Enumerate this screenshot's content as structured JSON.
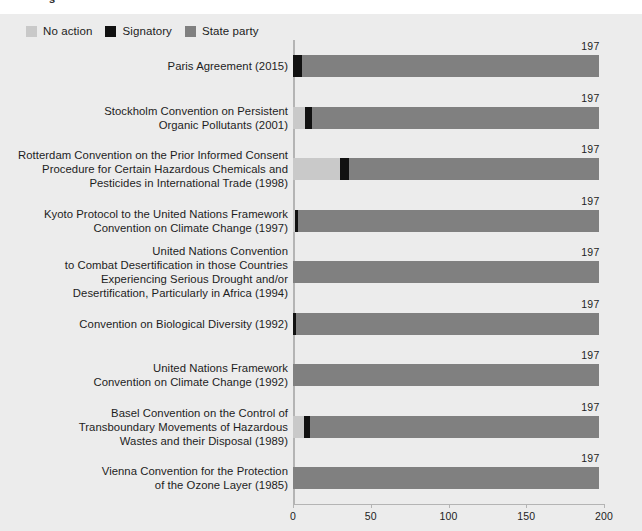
{
  "figure": {
    "cropped_top_text": "s",
    "background": "#ececec"
  },
  "legend": {
    "items": [
      {
        "label": "No action",
        "color": "#c9c9c9",
        "key": "no_action"
      },
      {
        "label": "Signatory",
        "color": "#111111",
        "key": "signatory"
      },
      {
        "label": "State party",
        "color": "#808080",
        "key": "state_party"
      }
    ]
  },
  "chart_data": {
    "type": "bar",
    "orientation": "horizontal",
    "stacked": true,
    "title": "",
    "subtitle": "",
    "xlabel": "",
    "ylabel": "",
    "xlim": [
      0,
      200
    ],
    "xticks": [
      0,
      50,
      100,
      150,
      200
    ],
    "xtick_labels": [
      "0",
      "50",
      "100",
      "150",
      "200"
    ],
    "grid": false,
    "legend_position": "top-left",
    "total_label_suffix": "",
    "series": [
      {
        "name": "No action",
        "color": "#c9c9c9",
        "values": [
          0,
          8,
          30,
          1,
          0,
          0,
          0,
          7,
          0
        ]
      },
      {
        "name": "Signatory",
        "color": "#111111",
        "values": [
          6,
          4,
          6,
          2,
          0,
          2,
          0,
          4,
          0
        ]
      },
      {
        "name": "State party",
        "color": "#808080",
        "values": [
          191,
          185,
          161,
          194,
          197,
          195,
          197,
          186,
          197
        ]
      }
    ],
    "categories": [
      "Paris Agreement (2015)",
      "Stockholm Convention on Persistent Organic Pollutants (2001)",
      "Rotterdam Convention on the Prior Informed Consent Procedure for Certain Hazardous Chemicals and Pesticides in International Trade (1998)",
      "Kyoto Protocol to the United Nations Framework Convention on Climate Change (1997)",
      "United Nations Convention to Combat Desertification in those Countries Experiencing Serious Drought and/or Desertification, Particularly in Africa (1994)",
      "Convention on Biological Diversity (1992)",
      "United Nations Framework Convention on Climate Change (1992)",
      "Basel Convention on the Control of Transboundary Movements of Hazardous Wastes and their Disposal (1989)",
      "Vienna Convention for the Protection of the Ozone Layer (1985)"
    ],
    "totals": [
      197,
      197,
      197,
      197,
      197,
      197,
      197,
      197,
      197
    ],
    "rows": [
      {
        "label_lines": [
          "Paris Agreement (2015)"
        ],
        "total": "197",
        "segments": [
          {
            "series": "No action",
            "value": 0
          },
          {
            "series": "Signatory",
            "value": 6
          },
          {
            "series": "State party",
            "value": 191
          }
        ]
      },
      {
        "label_lines": [
          "Stockholm Convention on Persistent",
          "Organic Pollutants (2001)"
        ],
        "total": "197",
        "segments": [
          {
            "series": "No action",
            "value": 8
          },
          {
            "series": "Signatory",
            "value": 4
          },
          {
            "series": "State party",
            "value": 185
          }
        ]
      },
      {
        "label_lines": [
          "Rotterdam Convention on the Prior Informed Consent",
          "Procedure for Certain Hazardous Chemicals and",
          "Pesticides in International Trade (1998)"
        ],
        "total": "197",
        "segments": [
          {
            "series": "No action",
            "value": 30
          },
          {
            "series": "Signatory",
            "value": 6
          },
          {
            "series": "State party",
            "value": 161
          }
        ]
      },
      {
        "label_lines": [
          "Kyoto Protocol to the United Nations Framework",
          "Convention on Climate Change (1997)"
        ],
        "total": "197",
        "segments": [
          {
            "series": "No action",
            "value": 1
          },
          {
            "series": "Signatory",
            "value": 2
          },
          {
            "series": "State party",
            "value": 194
          }
        ]
      },
      {
        "label_lines": [
          "United Nations Convention",
          "to Combat Desertification in those Countries",
          "Experiencing Serious Drought and/or",
          "Desertification, Particularly in Africa (1994)"
        ],
        "total": "197",
        "segments": [
          {
            "series": "No action",
            "value": 0
          },
          {
            "series": "Signatory",
            "value": 0
          },
          {
            "series": "State party",
            "value": 197
          }
        ]
      },
      {
        "label_lines": [
          "Convention on Biological Diversity (1992)"
        ],
        "total": "197",
        "segments": [
          {
            "series": "No action",
            "value": 0
          },
          {
            "series": "Signatory",
            "value": 2
          },
          {
            "series": "State party",
            "value": 195
          }
        ]
      },
      {
        "label_lines": [
          "United Nations Framework",
          "Convention on Climate Change (1992)"
        ],
        "total": "197",
        "segments": [
          {
            "series": "No action",
            "value": 0
          },
          {
            "series": "Signatory",
            "value": 0
          },
          {
            "series": "State party",
            "value": 197
          }
        ]
      },
      {
        "label_lines": [
          "Basel Convention on the Control of",
          "Transboundary Movements of Hazardous",
          "Wastes and their Disposal (1989)"
        ],
        "total": "197",
        "segments": [
          {
            "series": "No action",
            "value": 7
          },
          {
            "series": "Signatory",
            "value": 4
          },
          {
            "series": "State party",
            "value": 186
          }
        ]
      },
      {
        "label_lines": [
          "Vienna Convention for the Protection",
          "of the Ozone Layer (1985)"
        ],
        "total": "197",
        "segments": [
          {
            "series": "No action",
            "value": 0
          },
          {
            "series": "Signatory",
            "value": 0
          },
          {
            "series": "State party",
            "value": 197
          }
        ]
      }
    ]
  }
}
